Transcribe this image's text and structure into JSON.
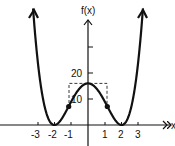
{
  "chart_data": {
    "type": "line",
    "title": "",
    "function": "f(x) = (x^2 - 4)^2",
    "ylabel": "f(x)",
    "xlabel": "x",
    "x_ticks": [
      -3,
      -2,
      -1,
      1,
      2,
      3
    ],
    "x_tick_labels": [
      "-3",
      "-2",
      "-1",
      "1",
      "2",
      "3"
    ],
    "y_ticks": [
      10,
      20,
      30
    ],
    "y_tick_labels": [
      "10",
      "20"
    ],
    "xlim": [
      -5.2,
      5.1
    ],
    "ylim": [
      -5,
      47
    ],
    "series": [
      {
        "name": "f(x)",
        "x": [
          -3.27,
          -3.0,
          -2.5,
          -2.0,
          -1.5,
          -1.15,
          -1.0,
          -0.5,
          0,
          0.5,
          1.0,
          1.15,
          1.5,
          2.0,
          2.5,
          3.0,
          3.27
        ],
        "y": [
          44.9,
          25.0,
          5.06,
          0,
          3.06,
          7.1,
          9.0,
          14.06,
          16,
          14.06,
          9.0,
          7.1,
          3.06,
          0,
          5.06,
          25.0,
          44.9
        ]
      }
    ],
    "marked_points": [
      {
        "x": -1.15,
        "y": 7.1,
        "label": "inflection"
      },
      {
        "x": 1.15,
        "y": 7.1,
        "label": "inflection"
      }
    ],
    "annotations": [
      {
        "type": "dashed-box",
        "x_range": [
          -1.15,
          1.15
        ],
        "y_top": 16,
        "y_bottom": 7.1
      }
    ],
    "grid": false,
    "legend": "none"
  },
  "labels": {
    "y_axis": "f(x)",
    "x_axis": "x",
    "tick_20": "20",
    "tick_10": "10",
    "x_neg3": "-3",
    "x_neg2": "-2",
    "x_neg1": "-1",
    "x_1": "1",
    "x_2": "2",
    "x_3": "3"
  }
}
